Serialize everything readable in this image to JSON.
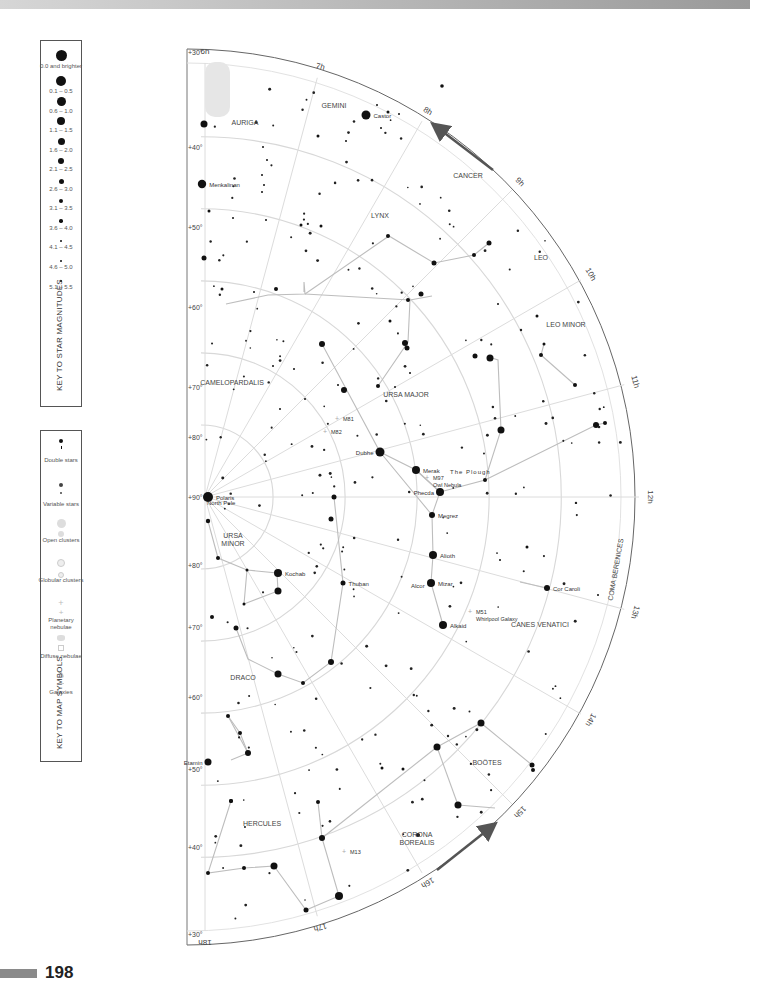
{
  "page": {
    "number": "198"
  },
  "magnitude_key": {
    "title": "KEY TO STAR MAGNITUDES",
    "items": [
      {
        "label": "0.0 and brighter",
        "r": 5.5
      },
      {
        "label": "0.1 – 0.5",
        "r": 5
      },
      {
        "label": "0.6 – 1.0",
        "r": 4.5
      },
      {
        "label": "1.1 – 1.5",
        "r": 4
      },
      {
        "label": "1.6 – 2.0",
        "r": 3.5
      },
      {
        "label": "2.1 – 2.5",
        "r": 3
      },
      {
        "label": "2.6 – 3.0",
        "r": 2.5
      },
      {
        "label": "3.1 – 3.5",
        "r": 2
      },
      {
        "label": "3.6 – 4.0",
        "r": 1.7
      },
      {
        "label": "4.1 – 4.5",
        "r": 1.4
      },
      {
        "label": "4.6 – 5.0",
        "r": 1.1
      },
      {
        "label": "5.1 – 5.5",
        "r": 0.8
      }
    ]
  },
  "symbol_key": {
    "title": "KEY TO MAP SYMBOLS",
    "items": [
      {
        "label": "Double stars",
        "symbol": "double-star"
      },
      {
        "label": "Variable stars",
        "symbol": "variable-star"
      },
      {
        "label": "Open clusters",
        "symbol": "open-cluster"
      },
      {
        "label": "Globular clusters",
        "symbol": "globular-cluster"
      },
      {
        "label": "Planetary nebulae",
        "symbol": "planetary-nebula"
      },
      {
        "label": "Diffuse nebulae",
        "symbol": "diffuse-nebula"
      },
      {
        "label": "Galaxies",
        "symbol": "galaxy"
      }
    ]
  },
  "chart": {
    "declinations": [
      "+30°",
      "+40°",
      "+50°",
      "+60°",
      "+70°",
      "+80°",
      "+90°",
      "+80°",
      "+70°",
      "+60°",
      "+50°",
      "+40°",
      "+30°"
    ],
    "right_ascension": [
      "6h",
      "7h",
      "8h",
      "9h",
      "10h",
      "11h",
      "12h",
      "13h",
      "14h",
      "15h",
      "16h",
      "17h",
      "18h"
    ],
    "constellations": [
      "AURIGA",
      "GEMINI",
      "CANCER",
      "LYNX",
      "LEO",
      "LEO MINOR",
      "CAMELOPARDALIS",
      "URSA MAJOR",
      "URSA MINOR",
      "DRACO",
      "CANES VENATICI",
      "COMA BERENICES",
      "BOÖTES",
      "CORONA BOREALIS",
      "HERCULES"
    ],
    "named_stars": [
      "Castor",
      "Menkalinan",
      "Dubhe",
      "Merak",
      "Phecda",
      "Megrez",
      "Alioth",
      "Mizar",
      "Alcor",
      "Alkaid",
      "Polaris",
      "Kochab",
      "Thuban",
      "Etamin",
      "Cor Caroli"
    ],
    "deep_sky": [
      {
        "id": "M97",
        "name": "Owl Nebula"
      },
      {
        "id": "M51",
        "name": "Whirlpool Galaxy"
      },
      {
        "id": "M81",
        "name": ""
      },
      {
        "id": "M82",
        "name": ""
      },
      {
        "id": "M13",
        "name": ""
      }
    ],
    "asterism": "The Plough",
    "north_pole": {
      "label": "North Pole",
      "star": "Polaris",
      "greek": "α"
    },
    "colors": {
      "line": "#bdbdbd",
      "grid": "#e2e2e2",
      "star": "#111111",
      "border": "#555555",
      "arrow": "#555555"
    }
  }
}
